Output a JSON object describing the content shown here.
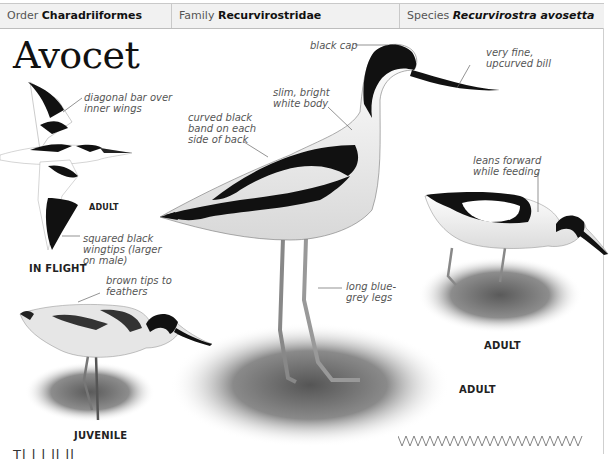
{
  "header": {
    "order_label": "Order",
    "order_value": "Charadriiformes",
    "family_label": "Family",
    "family_value": "Recurvirostridae",
    "species_label": "Species",
    "species_value": "Recurvirostra avosetta"
  },
  "title": "Avocet",
  "annotations": {
    "black_cap": "black cap",
    "bill": [
      "very fine,",
      "upcurved bill"
    ],
    "body": [
      "slim, bright",
      "white body"
    ],
    "back_band": [
      "curved black",
      "band on each",
      "side of back"
    ],
    "wing_bar": [
      "diagonal bar over",
      "inner wings"
    ],
    "wingtips": [
      "squared black",
      "wingtips (larger",
      "on male)"
    ],
    "juvenile_tips": [
      "brown tips to",
      "feathers"
    ],
    "legs": [
      "long blue-",
      "grey legs"
    ],
    "feeding": [
      "leans forward",
      "while feeding"
    ]
  },
  "captions": {
    "flight_age": "ADULT",
    "in_flight": "IN FLIGHT",
    "juvenile": "JUVENILE",
    "standing_adult": "ADULT",
    "feeding_adult": "ADULT"
  },
  "figures": [
    {
      "name": "adult-in-flight",
      "caption": "IN FLIGHT"
    },
    {
      "name": "adult-standing",
      "caption": "ADULT"
    },
    {
      "name": "adult-feeding",
      "caption": "ADULT"
    },
    {
      "name": "juvenile-feeding",
      "caption": "JUVENILE"
    }
  ],
  "body_text_fragment": "Tl        l      l                   ll ll",
  "colors": {
    "header_bg": "#f1f1f1",
    "rule": "#c9c9c9",
    "note_text": "#555555",
    "bird_black": "#111111"
  }
}
